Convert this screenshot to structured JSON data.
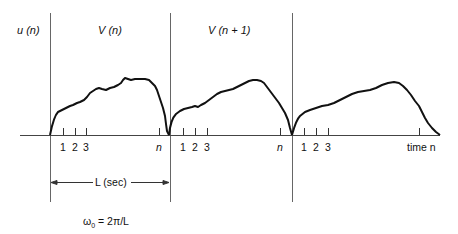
{
  "diagram": {
    "signal_label": "u (n)",
    "windows": [
      {
        "label": "V (n)"
      },
      {
        "label": "V (n + 1)"
      }
    ],
    "tick_labels_per_window": [
      "1",
      "2",
      "3",
      "n"
    ],
    "axis_label": "time n",
    "period_label": "L (sec)",
    "formula": "ω0 = 2π/L",
    "formula_parts": {
      "omega": "ω",
      "sub": "0",
      "rest": " = 2π/L"
    },
    "colors": {
      "curve": "#111111",
      "axis": "#222222",
      "divider": "#555555"
    }
  }
}
